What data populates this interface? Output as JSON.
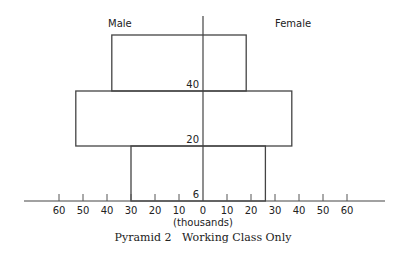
{
  "chart_data": {
    "type": "bar",
    "subtype": "population-pyramid",
    "title": "Pyramid 2   Working Class Only",
    "xlabel": "(thousands)",
    "ylabel": "",
    "left_label": "Male",
    "right_label": "Female",
    "x_ticks": [
      60,
      50,
      40,
      30,
      20,
      10,
      0,
      10,
      20,
      30,
      40,
      50,
      60
    ],
    "xlim": [
      -60,
      60
    ],
    "age_labels": [
      "6",
      "20",
      "40"
    ],
    "categories": [
      "6-20",
      "20-40",
      "40+"
    ],
    "series": [
      {
        "name": "Male",
        "values": [
          30,
          53,
          38
        ]
      },
      {
        "name": "Female",
        "values": [
          26,
          37,
          18
        ]
      }
    ],
    "grid": false,
    "legend": "none"
  },
  "labels": {
    "male": "Male",
    "female": "Female",
    "age_6": "6",
    "age_20": "20",
    "age_40": "40",
    "units": "(thousands)",
    "caption": "Pyramid 2   Working Class Only"
  }
}
